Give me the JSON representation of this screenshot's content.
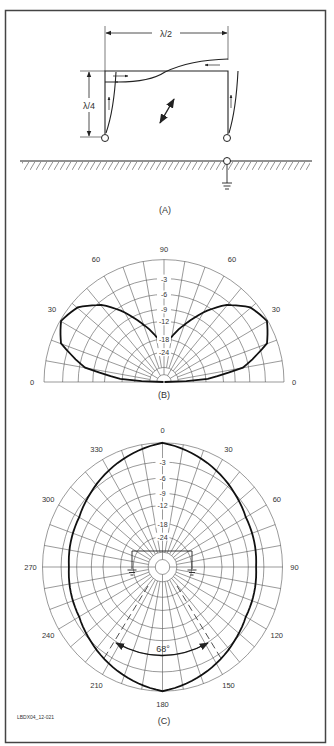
{
  "figure_id": "LBDX04_12-021",
  "panels": {
    "A": {
      "label": "(A)",
      "dim_horizontal": "λ/2",
      "dim_vertical": "λ/4"
    },
    "B": {
      "label": "(B)",
      "angle_labels": [
        "0",
        "30",
        "60",
        "90",
        "60",
        "30",
        "0"
      ],
      "db_labels": [
        "-3",
        "-6",
        "-9",
        "-12",
        "-18",
        "-24"
      ]
    },
    "C": {
      "label": "(C)",
      "angle_labels": [
        "0",
        "30",
        "60",
        "90",
        "120",
        "150",
        "180",
        "210",
        "240",
        "270",
        "300",
        "330"
      ],
      "db_labels": [
        "-3",
        "-6",
        "-9",
        "-12",
        "-18",
        "-24"
      ],
      "beamwidth": "68°"
    }
  },
  "chart_data": [
    {
      "type": "polar",
      "title": "(B) Elevation pattern",
      "angles_deg": [
        0,
        10,
        20,
        30,
        40,
        50,
        60,
        70,
        80,
        90
      ],
      "relative_db": [
        -24,
        -7,
        -1.5,
        0,
        -1,
        -3.5,
        -7.5,
        -12,
        -17,
        -19
      ],
      "symmetric": true,
      "ring_db": [
        0,
        -3,
        -6,
        -9,
        -12,
        -18,
        -24
      ],
      "angle_ticks": [
        0,
        30,
        60,
        90,
        60,
        30,
        0
      ]
    },
    {
      "type": "polar",
      "title": "(C) Azimuth pattern",
      "angles_deg": [
        0,
        30,
        60,
        90,
        120,
        150,
        180
      ],
      "relative_db": [
        0,
        -2,
        -4,
        -4.5,
        -4,
        -2,
        0
      ],
      "ring_db": [
        0,
        -3,
        -6,
        -9,
        -12,
        -18,
        -24
      ],
      "angle_ticks": [
        0,
        30,
        60,
        90,
        120,
        150,
        180,
        210,
        240,
        270,
        300,
        330
      ],
      "annotation": "68°"
    }
  ]
}
